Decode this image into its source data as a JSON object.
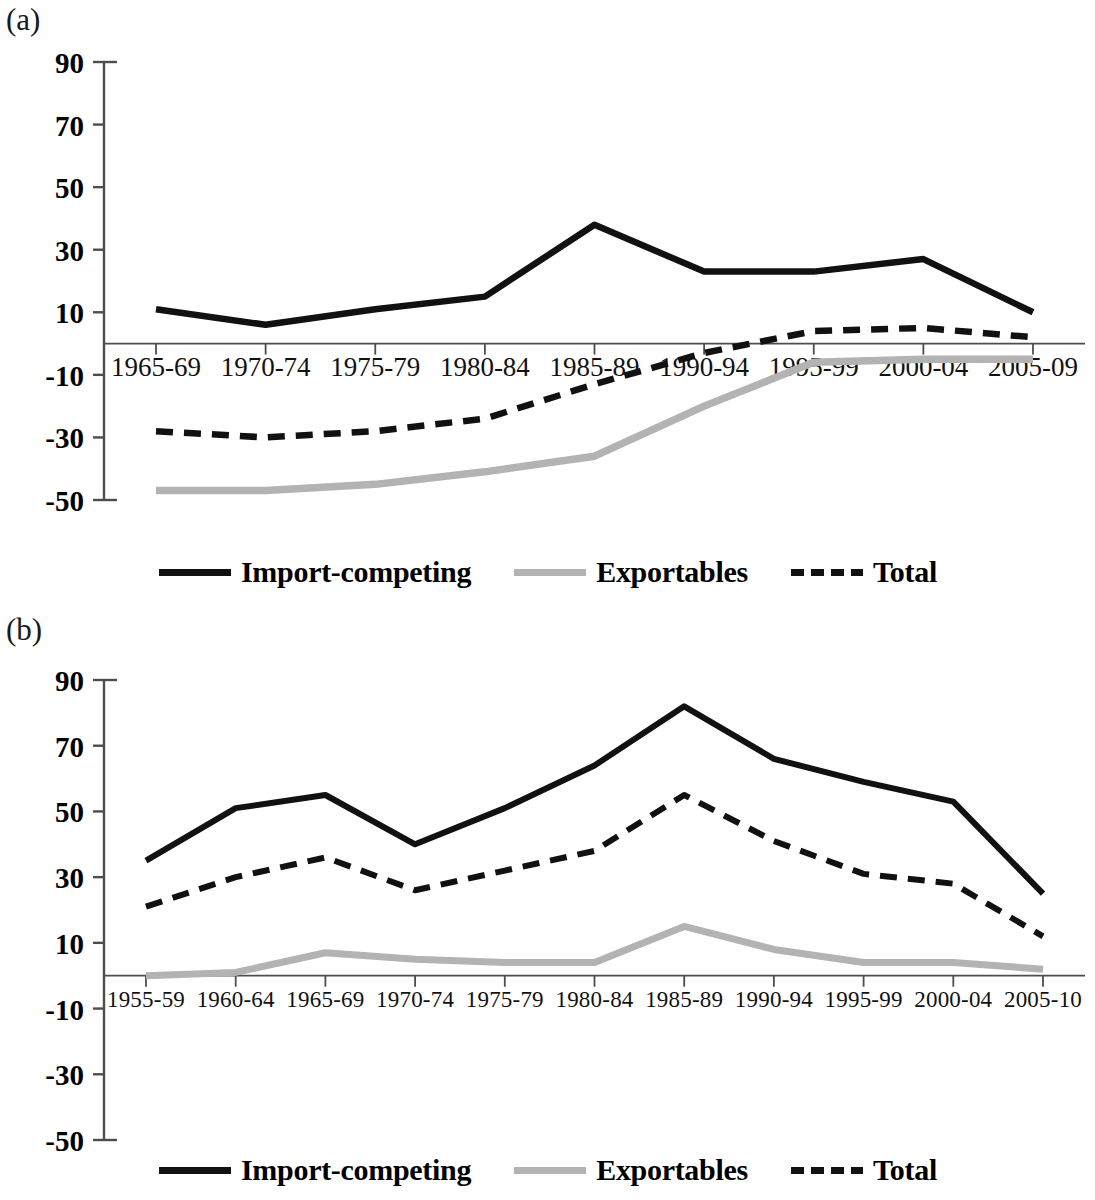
{
  "figure": {
    "panels": [
      {
        "id": "a",
        "label": "(a)"
      },
      {
        "id": "b",
        "label": "(b)"
      }
    ],
    "series_colors": {
      "import_competing": "#111111",
      "exportables": "#b3b3b3",
      "total": "#111111"
    },
    "legend": {
      "items": [
        {
          "name": "import-competing",
          "label": "Import-competing",
          "style": "solid",
          "color": "#111111"
        },
        {
          "name": "exportables",
          "label": "Exportables",
          "style": "solid",
          "color": "#b3b3b3"
        },
        {
          "name": "total",
          "label": "Total",
          "style": "dashed",
          "color": "#111111"
        }
      ]
    }
  },
  "chart_data": [
    {
      "type": "line",
      "panel": "a",
      "title": "",
      "xlabel": "",
      "ylabel": "",
      "ylim": [
        -50,
        90
      ],
      "yticks": [
        90,
        70,
        50,
        30,
        10,
        -10,
        -30,
        -50
      ],
      "ytick_labels": [
        "90",
        "70",
        "50",
        "30",
        "10",
        "-10",
        "-30",
        "-50"
      ],
      "grid": false,
      "legend_position": "bottom",
      "categories": [
        "1965-69",
        "1970-74",
        "1975-79",
        "1980-84",
        "1985-89",
        "1990-94",
        "1995-99",
        "2000-04",
        "2005-09"
      ],
      "series": [
        {
          "name": "Import-competing",
          "style": "solid",
          "color": "#111111",
          "values": [
            11,
            6,
            11,
            15,
            38,
            23,
            23,
            27,
            10
          ]
        },
        {
          "name": "Exportables",
          "style": "solid",
          "color": "#b3b3b3",
          "values": [
            -47,
            -47,
            -45,
            -41,
            -36,
            -20,
            -6,
            -5,
            -5
          ]
        },
        {
          "name": "Total",
          "style": "dashed",
          "color": "#111111",
          "values": [
            -28,
            -30,
            -28,
            -24,
            -13,
            -3,
            4,
            5,
            2
          ]
        }
      ]
    },
    {
      "type": "line",
      "panel": "b",
      "title": "",
      "xlabel": "",
      "ylabel": "",
      "ylim": [
        -50,
        90
      ],
      "yticks": [
        90,
        70,
        50,
        30,
        10,
        -10,
        -30,
        -50
      ],
      "ytick_labels": [
        "90",
        "70",
        "50",
        "30",
        "10",
        "-10",
        "-30",
        "-50"
      ],
      "grid": false,
      "legend_position": "bottom",
      "categories": [
        "1955-59",
        "1960-64",
        "1965-69",
        "1970-74",
        "1975-79",
        "1980-84",
        "1985-89",
        "1990-94",
        "1995-99",
        "2000-04",
        "2005-10"
      ],
      "series": [
        {
          "name": "Import-competing",
          "style": "solid",
          "color": "#111111",
          "values": [
            35,
            51,
            55,
            40,
            51,
            64,
            82,
            66,
            59,
            53,
            25
          ]
        },
        {
          "name": "Exportables",
          "style": "solid",
          "color": "#b3b3b3",
          "values": [
            0,
            1,
            7,
            5,
            4,
            4,
            15,
            8,
            4,
            4,
            2
          ]
        },
        {
          "name": "Total",
          "style": "dashed",
          "color": "#111111",
          "values": [
            21,
            30,
            36,
            26,
            32,
            38,
            55,
            41,
            31,
            28,
            12
          ]
        }
      ]
    }
  ]
}
